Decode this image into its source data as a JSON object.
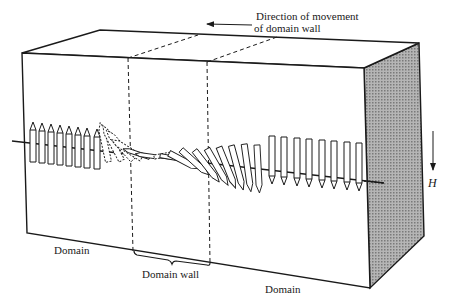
{
  "figure": {
    "type": "domain-wall-schematic",
    "colors": {
      "line": "#1a1a1a",
      "side_face": "#9a9a9a",
      "background": "#ffffff"
    }
  },
  "labels": {
    "movement_line1": "Direction of movement",
    "movement_line2": "of domain wall",
    "field": "H",
    "domain_left": "Domain",
    "domain_wall": "Domain wall",
    "domain_right": "Domain"
  },
  "arrows": {
    "left_domain_count": 8,
    "wall_rotating_count": 16,
    "right_domain_count": 8
  }
}
